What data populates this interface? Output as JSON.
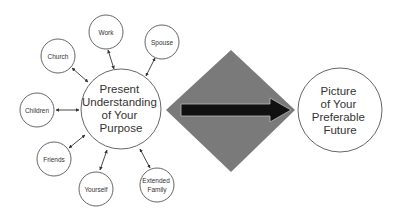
{
  "diagram": {
    "center_node": {
      "lines": [
        "Present",
        "Understanding",
        "of Your",
        "Purpose"
      ],
      "cx": 121,
      "cy": 109,
      "r": 40
    },
    "target_node": {
      "lines": [
        "Picture",
        "of Your",
        "Preferable",
        "Future"
      ],
      "cx": 340,
      "cy": 110,
      "r": 42
    },
    "connector": {
      "shape": "diamond",
      "fill_color": "#7a7a7a",
      "arrow_color": "#111111",
      "direction": "right"
    },
    "satellite_nodes": [
      {
        "id": "work",
        "lines": [
          "Work"
        ],
        "cx": 106,
        "cy": 32,
        "r": 17
      },
      {
        "id": "spouse",
        "lines": [
          "Spouse"
        ],
        "cx": 162,
        "cy": 42,
        "r": 17
      },
      {
        "id": "church",
        "lines": [
          "Church"
        ],
        "cx": 58,
        "cy": 56,
        "r": 17
      },
      {
        "id": "children",
        "lines": [
          "Children"
        ],
        "cx": 37,
        "cy": 110,
        "r": 17
      },
      {
        "id": "friends",
        "lines": [
          "Friends"
        ],
        "cx": 54,
        "cy": 159,
        "r": 17
      },
      {
        "id": "yourself",
        "lines": [
          "Yourself"
        ],
        "cx": 96,
        "cy": 189,
        "r": 17
      },
      {
        "id": "extended-family",
        "lines": [
          "Extended",
          "Family"
        ],
        "cx": 157,
        "cy": 185,
        "r": 17
      }
    ],
    "edges": "bidirectional arrows between center node and each satellite node"
  }
}
